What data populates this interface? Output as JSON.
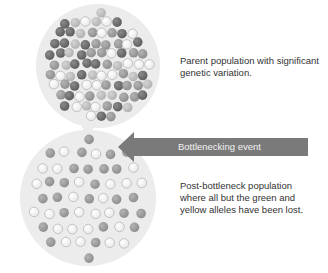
{
  "diagram": {
    "parent_label": "Parent population with significant genetic variation.",
    "arrow_label": "Bottlenecking event",
    "post_label": "Post-bottleneck population where all but the green and yellow alleles have been lost."
  },
  "colors": {
    "circle_fill": "#ececec",
    "arrow_fill": "#7a7a7a",
    "allele_dark": "#6f6f6f",
    "allele_mid": "#9a9a9a",
    "allele_light": "#bdbdbd",
    "allele_white": "#ffffff"
  },
  "populations": {
    "parent": {
      "cx": 98,
      "cy": 66,
      "r": 62,
      "alleles": [
        "dark",
        "mid",
        "light",
        "white"
      ]
    },
    "post": {
      "cx": 88,
      "cy": 198,
      "r": 68,
      "alleles": [
        "mid",
        "white"
      ]
    }
  }
}
